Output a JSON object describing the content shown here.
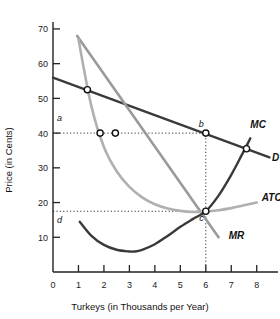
{
  "chart_data": {
    "type": "line",
    "title": "",
    "xlabel": "Turkeys (in Thousands per Year)",
    "ylabel": "Price (in Cents)",
    "xlim": [
      0,
      8.6
    ],
    "ylim": [
      0,
      72
    ],
    "xticks": [
      "0",
      "1",
      "2",
      "3",
      "4",
      "5",
      "6",
      "7",
      "8"
    ],
    "xtick_values": [
      0,
      1,
      2,
      3,
      4,
      5,
      6,
      7,
      8
    ],
    "yticks": [
      "10",
      "20",
      "30",
      "40",
      "50",
      "60",
      "70"
    ],
    "ytick_values": [
      10,
      20,
      30,
      40,
      50,
      60,
      70
    ],
    "grid": false,
    "legend": "inline-curve-labels",
    "series": [
      {
        "name": "D",
        "label": "D",
        "color": "#3a3a3a",
        "description": "Demand curve, downward sloping straight line",
        "points": [
          [
            0,
            56
          ],
          [
            8.5,
            33
          ]
        ]
      },
      {
        "name": "MR",
        "label": "MR",
        "color": "#9a9a9a",
        "description": "Marginal revenue, steep downward sloping straight line",
        "points": [
          [
            0.95,
            68
          ],
          [
            6.5,
            10
          ]
        ]
      },
      {
        "name": "ATC",
        "label": "ATC",
        "color": "#b0b0b0",
        "description": "Average total cost, U-shaped curve with minimum near 6 thousand",
        "points": [
          [
            1.0,
            67
          ],
          [
            1.5,
            48
          ],
          [
            2.0,
            36
          ],
          [
            2.5,
            29
          ],
          [
            3.0,
            24.5
          ],
          [
            3.5,
            21.5
          ],
          [
            4.0,
            19.5
          ],
          [
            4.5,
            18.3
          ],
          [
            5.0,
            17.6
          ],
          [
            5.5,
            17.3
          ],
          [
            6.0,
            17.4
          ],
          [
            6.5,
            17.8
          ],
          [
            7.0,
            18.4
          ],
          [
            7.5,
            19.2
          ],
          [
            8.0,
            20.0
          ]
        ]
      },
      {
        "name": "MC",
        "label": "MC",
        "color": "#3a3a3a",
        "description": "Marginal cost, U-shaped curve crossing MR and ATC at output 6",
        "points": [
          [
            1.05,
            14.5
          ],
          [
            1.5,
            10.5
          ],
          [
            2.0,
            7.8
          ],
          [
            2.5,
            6.4
          ],
          [
            3.0,
            5.9
          ],
          [
            3.2,
            5.9
          ],
          [
            3.5,
            6.4
          ],
          [
            4.0,
            8.0
          ],
          [
            4.5,
            10.4
          ],
          [
            5.0,
            13.0
          ],
          [
            5.5,
            15.3
          ],
          [
            6.0,
            17.5
          ],
          [
            6.5,
            22.0
          ],
          [
            7.0,
            28.0
          ],
          [
            7.4,
            33.5
          ],
          [
            7.75,
            38.5
          ]
        ]
      }
    ],
    "markers": [
      {
        "name": "demand-upper-point",
        "x": 1.35,
        "y": 52.5,
        "label": ""
      },
      {
        "name": "mr-at-price-a",
        "x": 1.85,
        "y": 40,
        "label": ""
      },
      {
        "name": "atc-at-price-a",
        "x": 2.45,
        "y": 40,
        "label": ""
      },
      {
        "name": "point-b",
        "x": 6.0,
        "y": 40,
        "label": "b"
      },
      {
        "name": "point-c",
        "x": 6.0,
        "y": 17.5,
        "label": "c"
      },
      {
        "name": "mc-demand-intersection",
        "x": 7.6,
        "y": 35.5,
        "label": ""
      }
    ],
    "axis_labels": [
      {
        "name": "price-level-a",
        "text": "a",
        "x": 0.2,
        "y": 43.5
      },
      {
        "name": "price-level-d",
        "text": "d",
        "x": 0.2,
        "y": 14.0
      }
    ],
    "curve_labels": [
      {
        "name": "curve-label-mc",
        "text": "MC",
        "x": 7.75,
        "y": 41.5
      },
      {
        "name": "curve-label-d",
        "text": "D",
        "x": 8.6,
        "y": 32.0
      },
      {
        "name": "curve-label-atc",
        "text": "ATC",
        "x": 8.2,
        "y": 20.5
      },
      {
        "name": "curve-label-mr",
        "text": "MR",
        "x": 6.9,
        "y": 9.5
      }
    ],
    "guide_lines": [
      {
        "name": "price-a-horizontal",
        "from": [
          0.0,
          40
        ],
        "to": [
          6.0,
          40
        ]
      },
      {
        "name": "price-d-horizontal",
        "from": [
          0.0,
          17.5
        ],
        "to": [
          6.0,
          17.5
        ]
      },
      {
        "name": "quantity-6-vertical",
        "from": [
          6.0,
          0
        ],
        "to": [
          6.0,
          40
        ]
      }
    ]
  }
}
